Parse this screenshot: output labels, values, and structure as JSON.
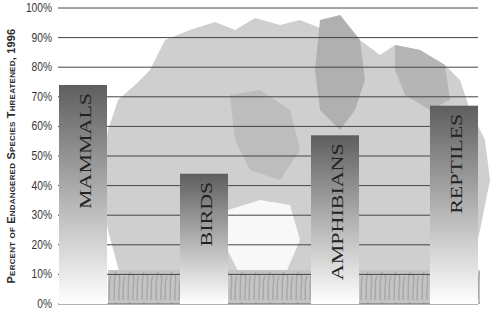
{
  "chart_data": {
    "type": "bar",
    "title": "",
    "xlabel": "",
    "ylabel": "Percent of Endangered Species Threatened, 1996",
    "categories": [
      "MAMMALS",
      "BIRDS",
      "AMPHIBIANS",
      "REPTILES"
    ],
    "values": [
      74,
      44,
      57,
      67
    ],
    "ylim": [
      0,
      100
    ],
    "yticks": [
      "0%",
      "10%",
      "20%",
      "30%",
      "40%",
      "50%",
      "60%",
      "70%",
      "80%",
      "90%",
      "100%"
    ],
    "grid": true,
    "legend": null,
    "label_position": "inside bar, vertical",
    "background": "tree silhouette illustration"
  },
  "colors": {
    "bar_top": "#5e5e5e",
    "bar_bottom": "#ffffff",
    "grid": "#444444",
    "tree_light": "#c9c9c9",
    "tree_dark": "#a9a9a9",
    "grass": "#b5b5b5"
  }
}
